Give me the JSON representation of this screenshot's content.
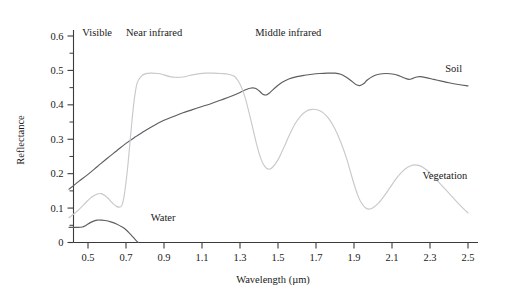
{
  "chart_data": {
    "type": "line",
    "title": "",
    "xlabel": "Wavelength (µm)",
    "ylabel": "Reflectance",
    "xlim": [
      0.4,
      2.55
    ],
    "ylim": [
      0,
      0.63
    ],
    "grid": false,
    "legend_position": "inline-right",
    "xticks": [
      "0.5",
      "0.7",
      "0.9",
      "1.1",
      "1.3",
      "1.5",
      "1.7",
      "1.9",
      "2.1",
      "2.3",
      "2.5"
    ],
    "xtick_values": [
      0.5,
      0.7,
      0.9,
      1.1,
      1.3,
      1.5,
      1.7,
      1.9,
      2.1,
      2.3,
      2.5
    ],
    "xtick_minor_values": [
      0.6,
      0.8,
      1.0,
      1.2,
      1.4,
      1.6,
      1.8,
      2.0,
      2.2,
      2.4
    ],
    "yticks": [
      "0",
      "0.1",
      "0.2",
      "0.3",
      "0.4",
      "0.5",
      "0.6"
    ],
    "ytick_values": [
      0,
      0.1,
      0.2,
      0.3,
      0.4,
      0.5,
      0.6
    ],
    "ytick_minor_values": [
      0.05,
      0.15,
      0.25,
      0.35,
      0.45,
      0.55
    ],
    "annotations": [
      {
        "text": "Visible",
        "x": 0.47,
        "y": 0.61
      },
      {
        "text": "Near infrared",
        "x": 0.7,
        "y": 0.61
      },
      {
        "text": "Middle infrared",
        "x": 1.38,
        "y": 0.61
      }
    ],
    "series": [
      {
        "name": "Soil",
        "color": "#5d5d63",
        "label_x": 2.38,
        "label_y": 0.505,
        "points": [
          [
            0.4,
            0.155
          ],
          [
            0.45,
            0.177
          ],
          [
            0.5,
            0.198
          ],
          [
            0.55,
            0.221
          ],
          [
            0.6,
            0.244
          ],
          [
            0.65,
            0.266
          ],
          [
            0.7,
            0.288
          ],
          [
            0.75,
            0.307
          ],
          [
            0.8,
            0.325
          ],
          [
            0.85,
            0.341
          ],
          [
            0.9,
            0.355
          ],
          [
            0.95,
            0.366
          ],
          [
            1.0,
            0.377
          ],
          [
            1.05,
            0.386
          ],
          [
            1.1,
            0.395
          ],
          [
            1.15,
            0.404
          ],
          [
            1.2,
            0.414
          ],
          [
            1.25,
            0.424
          ],
          [
            1.3,
            0.436
          ],
          [
            1.33,
            0.444
          ],
          [
            1.36,
            0.449
          ],
          [
            1.38,
            0.448
          ],
          [
            1.4,
            0.441
          ],
          [
            1.42,
            0.431
          ],
          [
            1.44,
            0.429
          ],
          [
            1.46,
            0.437
          ],
          [
            1.49,
            0.452
          ],
          [
            1.52,
            0.465
          ],
          [
            1.56,
            0.476
          ],
          [
            1.6,
            0.482
          ],
          [
            1.64,
            0.486
          ],
          [
            1.68,
            0.489
          ],
          [
            1.72,
            0.491
          ],
          [
            1.76,
            0.492
          ],
          [
            1.8,
            0.492
          ],
          [
            1.83,
            0.489
          ],
          [
            1.86,
            0.48
          ],
          [
            1.89,
            0.468
          ],
          [
            1.91,
            0.459
          ],
          [
            1.93,
            0.456
          ],
          [
            1.95,
            0.461
          ],
          [
            1.97,
            0.472
          ],
          [
            2.0,
            0.483
          ],
          [
            2.03,
            0.489
          ],
          [
            2.07,
            0.491
          ],
          [
            2.11,
            0.489
          ],
          [
            2.14,
            0.484
          ],
          [
            2.17,
            0.477
          ],
          [
            2.19,
            0.474
          ],
          [
            2.21,
            0.477
          ],
          [
            2.23,
            0.481
          ],
          [
            2.25,
            0.482
          ],
          [
            2.28,
            0.479
          ],
          [
            2.32,
            0.474
          ],
          [
            2.36,
            0.469
          ],
          [
            2.4,
            0.464
          ],
          [
            2.45,
            0.459
          ],
          [
            2.5,
            0.455
          ]
        ]
      },
      {
        "name": "Vegetation",
        "color": "#c9c9cc",
        "label_x": 2.26,
        "label_y": 0.195,
        "points": [
          [
            0.4,
            0.072
          ],
          [
            0.43,
            0.085
          ],
          [
            0.46,
            0.1
          ],
          [
            0.49,
            0.117
          ],
          [
            0.52,
            0.132
          ],
          [
            0.55,
            0.141
          ],
          [
            0.57,
            0.142
          ],
          [
            0.59,
            0.136
          ],
          [
            0.61,
            0.126
          ],
          [
            0.63,
            0.114
          ],
          [
            0.65,
            0.105
          ],
          [
            0.67,
            0.103
          ],
          [
            0.68,
            0.11
          ],
          [
            0.69,
            0.135
          ],
          [
            0.7,
            0.175
          ],
          [
            0.71,
            0.225
          ],
          [
            0.72,
            0.285
          ],
          [
            0.73,
            0.345
          ],
          [
            0.74,
            0.4
          ],
          [
            0.75,
            0.44
          ],
          [
            0.76,
            0.466
          ],
          [
            0.78,
            0.483
          ],
          [
            0.8,
            0.49
          ],
          [
            0.83,
            0.492
          ],
          [
            0.87,
            0.491
          ],
          [
            0.9,
            0.487
          ],
          [
            0.93,
            0.482
          ],
          [
            0.96,
            0.48
          ],
          [
            1.0,
            0.481
          ],
          [
            1.04,
            0.486
          ],
          [
            1.08,
            0.49
          ],
          [
            1.12,
            0.492
          ],
          [
            1.16,
            0.492
          ],
          [
            1.2,
            0.491
          ],
          [
            1.24,
            0.489
          ],
          [
            1.27,
            0.483
          ],
          [
            1.29,
            0.47
          ],
          [
            1.31,
            0.448
          ],
          [
            1.33,
            0.415
          ],
          [
            1.35,
            0.372
          ],
          [
            1.37,
            0.326
          ],
          [
            1.39,
            0.28
          ],
          [
            1.41,
            0.243
          ],
          [
            1.43,
            0.221
          ],
          [
            1.45,
            0.213
          ],
          [
            1.47,
            0.218
          ],
          [
            1.5,
            0.24
          ],
          [
            1.53,
            0.275
          ],
          [
            1.56,
            0.312
          ],
          [
            1.59,
            0.345
          ],
          [
            1.62,
            0.368
          ],
          [
            1.65,
            0.382
          ],
          [
            1.68,
            0.387
          ],
          [
            1.71,
            0.385
          ],
          [
            1.74,
            0.376
          ],
          [
            1.77,
            0.358
          ],
          [
            1.8,
            0.33
          ],
          [
            1.83,
            0.292
          ],
          [
            1.86,
            0.246
          ],
          [
            1.88,
            0.208
          ],
          [
            1.9,
            0.17
          ],
          [
            1.92,
            0.137
          ],
          [
            1.94,
            0.114
          ],
          [
            1.96,
            0.101
          ],
          [
            1.98,
            0.097
          ],
          [
            2.0,
            0.101
          ],
          [
            2.03,
            0.115
          ],
          [
            2.06,
            0.136
          ],
          [
            2.09,
            0.16
          ],
          [
            2.12,
            0.184
          ],
          [
            2.15,
            0.204
          ],
          [
            2.18,
            0.218
          ],
          [
            2.21,
            0.225
          ],
          [
            2.24,
            0.224
          ],
          [
            2.27,
            0.216
          ],
          [
            2.3,
            0.202
          ],
          [
            2.33,
            0.185
          ],
          [
            2.36,
            0.167
          ],
          [
            2.39,
            0.149
          ],
          [
            2.42,
            0.131
          ],
          [
            2.45,
            0.113
          ],
          [
            2.48,
            0.096
          ],
          [
            2.5,
            0.086
          ]
        ]
      },
      {
        "name": "Water",
        "color": "#5d5d63",
        "label_x": 0.83,
        "label_y": 0.072,
        "points": [
          [
            0.4,
            0.044
          ],
          [
            0.44,
            0.044
          ],
          [
            0.47,
            0.045
          ],
          [
            0.49,
            0.05
          ],
          [
            0.51,
            0.057
          ],
          [
            0.53,
            0.062
          ],
          [
            0.55,
            0.065
          ],
          [
            0.57,
            0.065
          ],
          [
            0.59,
            0.064
          ],
          [
            0.62,
            0.06
          ],
          [
            0.65,
            0.054
          ],
          [
            0.68,
            0.045
          ],
          [
            0.7,
            0.037
          ],
          [
            0.72,
            0.026
          ],
          [
            0.74,
            0.014
          ],
          [
            0.755,
            0.005
          ],
          [
            0.765,
            0.0
          ]
        ]
      }
    ]
  }
}
